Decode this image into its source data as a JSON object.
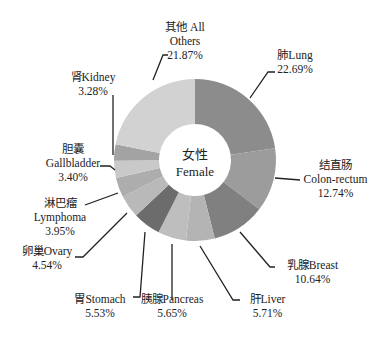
{
  "chart_data": {
    "type": "pie",
    "subtype": "donut",
    "title": "",
    "center_label": {
      "zh": "女性",
      "en": "Female"
    },
    "categories": [
      "肺Lung",
      "结直肠Colon-rectum",
      "乳腺Breast",
      "肝Liver",
      "胰腺Pancreas",
      "胃Stomach",
      "卵巢Ovary",
      "淋巴瘤Lymphoma",
      "胆囊Gallbladder",
      "肾Kidney",
      "其他 All Others"
    ],
    "values": [
      22.69,
      12.74,
      10.64,
      5.71,
      5.65,
      5.53,
      4.54,
      3.95,
      3.4,
      3.28,
      21.87
    ],
    "unit": "%",
    "colors": [
      "#8c8c8c",
      "#9c9c9c",
      "#808080",
      "#b4b4b4",
      "#bebebe",
      "#6c6c6c",
      "#b9b9b9",
      "#adadad",
      "#c9c9c9",
      "#a3a3a3",
      "#d2d2d2"
    ],
    "legend": "none (leader-line labels)"
  },
  "labels": {
    "lung": {
      "name": "肺Lung",
      "pct": "22.69%"
    },
    "colon": {
      "zh": "结直肠",
      "en": "Colon-rectum",
      "pct": "12.74%"
    },
    "breast": {
      "name": "乳腺Breast",
      "pct": "10.64%"
    },
    "liver": {
      "name": "肝Liver",
      "pct": "5.71%"
    },
    "pancreas": {
      "name": "胰腺Pancreas",
      "pct": "5.65%"
    },
    "stomach": {
      "name": "胃Stomach",
      "pct": "5.53%"
    },
    "ovary": {
      "name": "卵巢Ovary",
      "pct": "4.54%"
    },
    "lymphoma": {
      "zh": "淋巴瘤",
      "en": "Lymphoma",
      "pct": "3.95%"
    },
    "gallbladder": {
      "zh": "胆囊",
      "en": "Gallbladder",
      "pct": "3.40%"
    },
    "kidney": {
      "name": "肾Kidney",
      "pct": "3.28%"
    },
    "others": {
      "zh": "其他 All",
      "en": "Others",
      "pct": "21.87%"
    }
  },
  "center": {
    "zh": "女性",
    "en": "Female"
  }
}
